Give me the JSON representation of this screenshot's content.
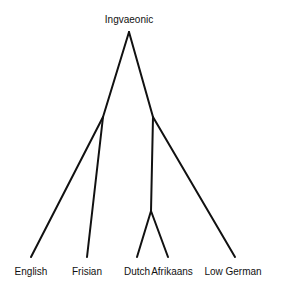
{
  "diagram": {
    "type": "tree",
    "root": {
      "label": "Ingvaeonic",
      "children": [
        {
          "label": "",
          "children": [
            {
              "label": "English"
            },
            {
              "label": "Frisian"
            }
          ]
        },
        {
          "label": "",
          "children": [
            {
              "label": "",
              "children": [
                {
                  "label": "Dutch"
                },
                {
                  "label": "Afrikaans"
                }
              ]
            },
            {
              "label": "Low German"
            }
          ]
        }
      ]
    },
    "nodes": {
      "root": {
        "label": "Ingvaeonic",
        "x": 129,
        "y": 32
      },
      "left_branch": {
        "x": 103,
        "y": 117
      },
      "right_branch": {
        "x": 153,
        "y": 117
      },
      "dutch_afrikaans_branch": {
        "x": 151,
        "y": 211
      },
      "english": {
        "label": "English",
        "x": 31,
        "y": 257
      },
      "frisian": {
        "label": "Frisian",
        "x": 87,
        "y": 257
      },
      "dutch": {
        "label": "Dutch",
        "x": 137,
        "y": 257
      },
      "afrikaans": {
        "label": "Afrikaans",
        "x": 168,
        "y": 257
      },
      "low_german": {
        "label": "Low German",
        "x": 235,
        "y": 257
      }
    },
    "line_color": "#111111"
  }
}
